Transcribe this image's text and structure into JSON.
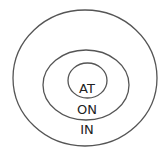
{
  "diagram": {
    "type": "concentric-circles",
    "rings": [
      {
        "name": "outer",
        "label": "IN"
      },
      {
        "name": "middle",
        "label": "ON"
      },
      {
        "name": "inner",
        "label": "AT"
      }
    ],
    "colors": {
      "stroke": "#555555",
      "text": "#222222",
      "background": "#ffffff"
    }
  }
}
